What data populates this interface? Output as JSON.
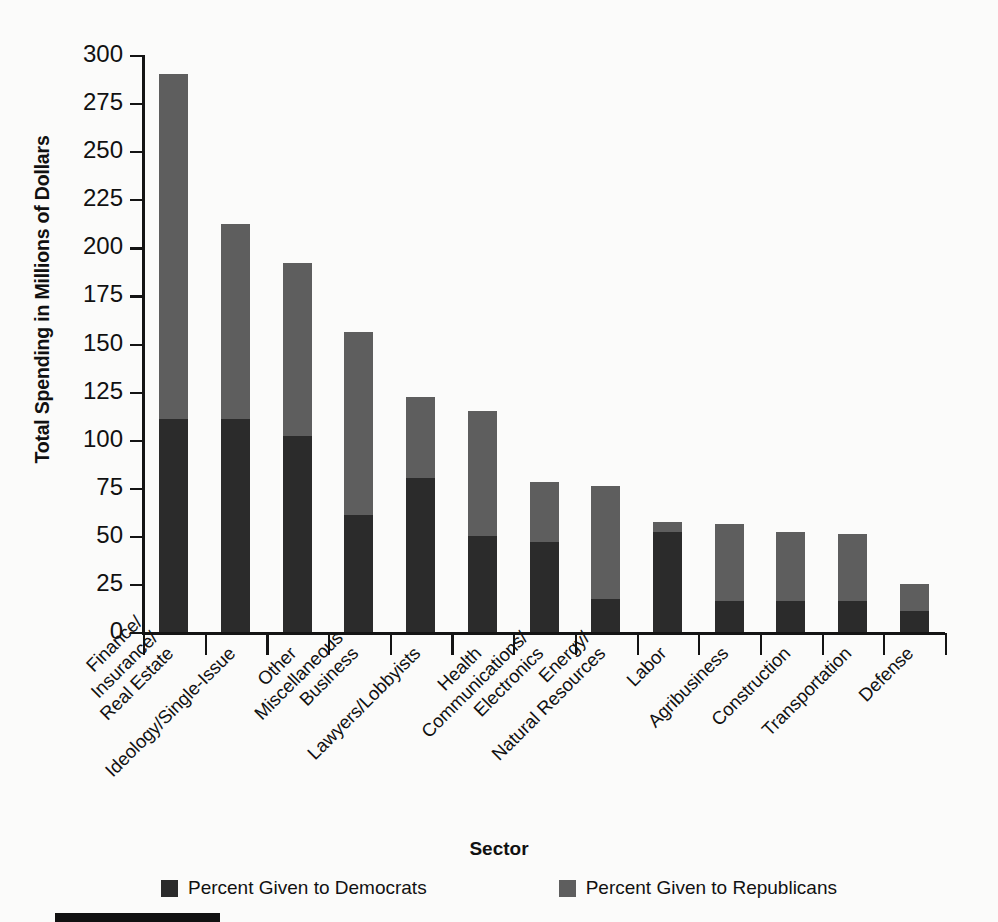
{
  "chart_data": {
    "type": "bar",
    "subtype": "stacked-vertical",
    "title": "",
    "xlabel": "Sector",
    "ylabel": "Total Spending in Millions of Dollars",
    "ylim": [
      0,
      300
    ],
    "ytick_step": 25,
    "ytick_labels": [
      "300",
      "275",
      "250",
      "225",
      "200",
      "175",
      "150",
      "125",
      "100",
      "75",
      "50",
      "25",
      "0"
    ],
    "ytick_values": [
      300,
      275,
      250,
      225,
      200,
      175,
      150,
      125,
      100,
      75,
      50,
      25,
      0
    ],
    "grid": false,
    "legend_position": "bottom",
    "categories": [
      "Finance/\nInsurance/\nReal Estate",
      "Ideology/Single-Issue",
      "Other",
      "Miscellaneous\nBusiness",
      "Lawyers/Lobbyists",
      "Health",
      "Communications/\nElectronics",
      "Energy/\nNatural Resources",
      "Labor",
      "Agribusiness",
      "Construction",
      "Transportation",
      "Defense"
    ],
    "series": [
      {
        "name": "Percent Given to Democrats",
        "color": "#2b2b2b",
        "values": [
          111,
          111,
          102,
          61,
          80,
          50,
          47,
          17,
          52,
          16,
          16,
          16,
          11
        ]
      },
      {
        "name": "Percent Given to Republicans",
        "color": "#5e5e5e",
        "values": [
          179,
          101,
          90,
          95,
          42,
          65,
          31,
          59,
          5,
          40,
          36,
          35,
          14
        ]
      }
    ],
    "totals": [
      290,
      212,
      192,
      156,
      122,
      115,
      78,
      76,
      57,
      56,
      52,
      51,
      25
    ]
  },
  "legend": {
    "items": [
      {
        "label": "Percent Given to Democrats",
        "color": "#2b2b2b"
      },
      {
        "label": "Percent Given to Republicans",
        "color": "#5e5e5e"
      }
    ]
  },
  "axes": {
    "x_title": "Sector",
    "y_title": "Total Spending in Millions of Dollars"
  },
  "colors": {
    "democrat": "#2b2b2b",
    "republican": "#5e5e5e",
    "axis": "#141414",
    "background": "#fbfbfa"
  }
}
